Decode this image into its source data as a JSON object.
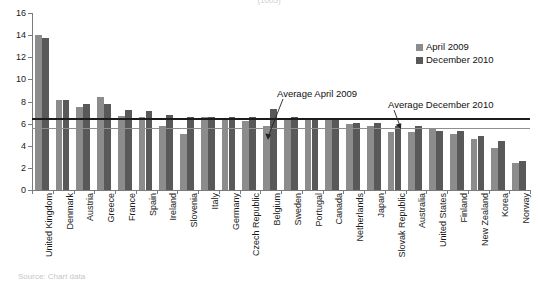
{
  "chart_data": {
    "type": "bar",
    "title": "",
    "xlabel": "",
    "ylabel": "",
    "ylim": [
      0,
      16
    ],
    "yticks": [
      0,
      2,
      4,
      6,
      8,
      10,
      12,
      14,
      16
    ],
    "grid": false,
    "legend_position": "top-right",
    "categories": [
      "United Kingdom",
      "Denmark",
      "Austria",
      "Greece",
      "France",
      "Spain",
      "Ireland",
      "Slovenia",
      "Italy",
      "Germany",
      "Czech Republic",
      "Belgium",
      "Sweden",
      "Portugal",
      "Canada",
      "Netherlands",
      "Japan",
      "Slovak Republic",
      "Australia",
      "United States",
      "Finland",
      "New Zealand",
      "Korea",
      "Norway"
    ],
    "series": [
      {
        "name": "April 2009",
        "color": "#8c8c8c",
        "values": [
          14.0,
          8.1,
          7.5,
          8.4,
          6.7,
          6.6,
          5.8,
          5.1,
          6.6,
          6.4,
          6.2,
          5.8,
          6.5,
          6.4,
          6.3,
          6.0,
          5.8,
          5.2,
          5.2,
          5.6,
          5.1,
          4.6,
          3.8,
          2.4
        ]
      },
      {
        "name": "December 2010",
        "color": "#595959",
        "values": [
          13.7,
          8.1,
          7.8,
          7.8,
          7.2,
          7.1,
          6.8,
          6.6,
          6.6,
          6.6,
          6.6,
          7.3,
          6.6,
          6.5,
          6.4,
          6.1,
          6.1,
          5.8,
          5.8,
          5.3,
          5.3,
          4.9,
          4.4,
          2.6
        ]
      }
    ],
    "reference_lines": [
      {
        "label": "Average April 2009",
        "value": 6.5,
        "color": "#1c1c1c",
        "style": "thick"
      },
      {
        "label": "Average December 2010",
        "value": 5.6,
        "color": "#8e8e8e",
        "style": "thin"
      }
    ],
    "annotations": [
      {
        "text": "Average April 2009"
      },
      {
        "text": "Average December 2010"
      }
    ]
  },
  "legend": {
    "items": [
      {
        "label": "April 2009"
      },
      {
        "label": "December 2010"
      }
    ]
  },
  "fragments": {
    "title_top": "(1005)",
    "source_bottom": "Source: Chart data"
  }
}
